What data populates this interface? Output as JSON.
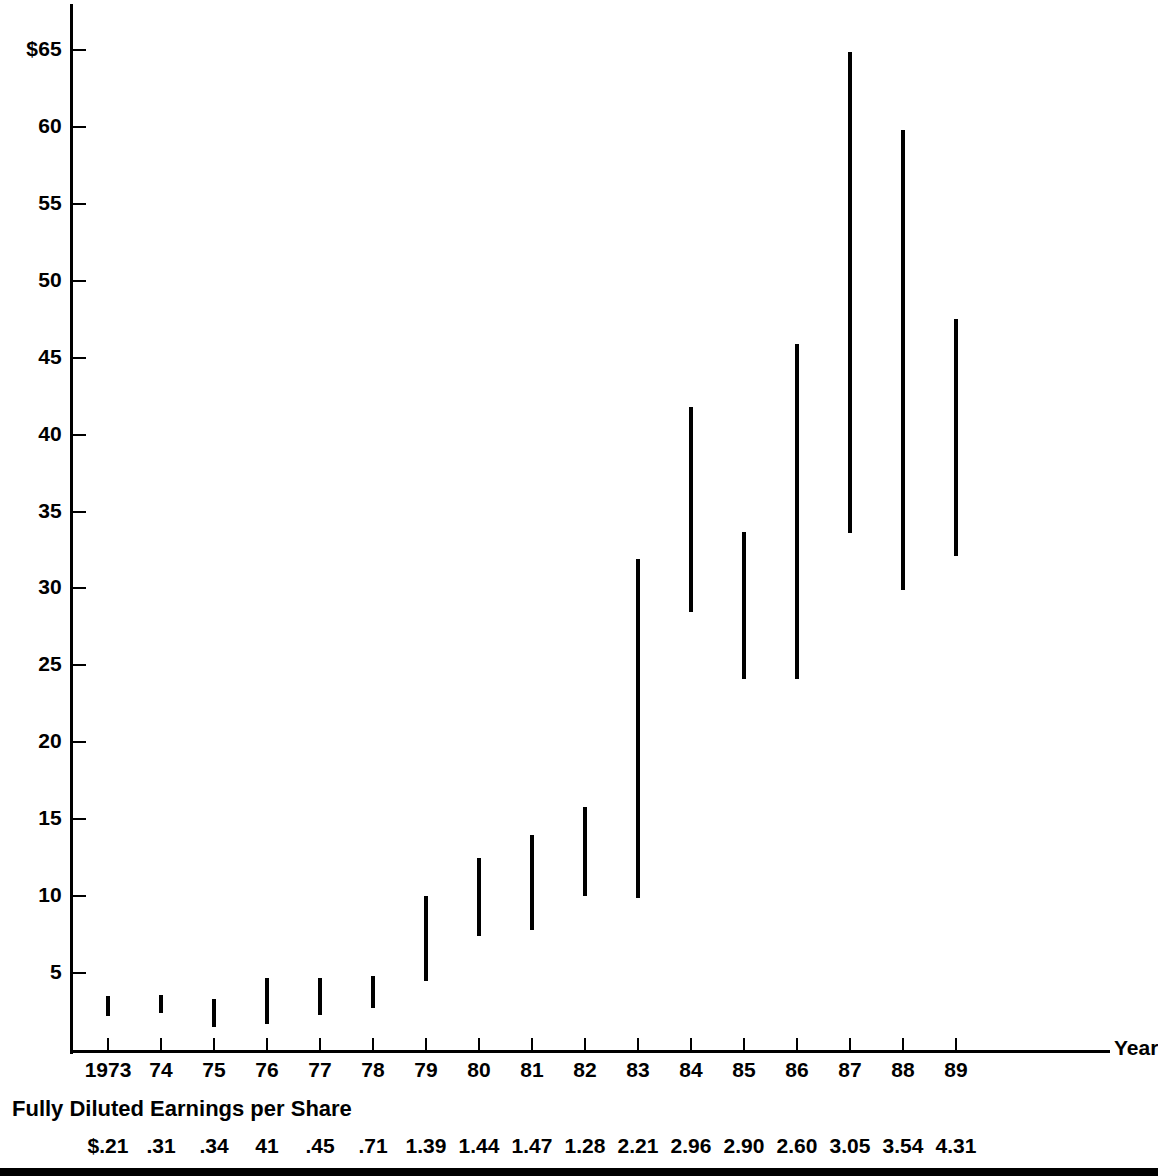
{
  "chart_data": {
    "type": "bar",
    "subtype": "high-low price range (floating bars)",
    "title": "",
    "title_note": "cropped off the top edge of the screenshot",
    "xlabel": "Year",
    "ylabel": "",
    "ylim": [
      0,
      67
    ],
    "grid": false,
    "legend": null,
    "y_ticks": [
      {
        "value": 65,
        "label": "$65"
      },
      {
        "value": 60,
        "label": "60"
      },
      {
        "value": 55,
        "label": "55"
      },
      {
        "value": 50,
        "label": "50"
      },
      {
        "value": 45,
        "label": "45"
      },
      {
        "value": 40,
        "label": "40"
      },
      {
        "value": 35,
        "label": "35"
      },
      {
        "value": 30,
        "label": "30"
      },
      {
        "value": 25,
        "label": "25"
      },
      {
        "value": 20,
        "label": "20"
      },
      {
        "value": 15,
        "label": "15"
      },
      {
        "value": 10,
        "label": "10"
      },
      {
        "value": 5,
        "label": "5"
      }
    ],
    "categories": [
      "1973",
      "74",
      "75",
      "76",
      "77",
      "78",
      "79",
      "80",
      "81",
      "82",
      "83",
      "84",
      "85",
      "86",
      "87",
      "88",
      "89"
    ],
    "series": [
      {
        "name": "Price range low",
        "values": [
          2.2,
          2.4,
          1.5,
          1.7,
          2.3,
          2.7,
          4.5,
          7.4,
          7.8,
          10.0,
          9.9,
          28.5,
          24.1,
          24.1,
          33.6,
          29.9,
          32.1
        ]
      },
      {
        "name": "Price range high",
        "values": [
          3.5,
          3.6,
          3.3,
          4.7,
          4.7,
          4.8,
          10.0,
          12.5,
          14.0,
          15.8,
          31.9,
          41.8,
          33.7,
          45.9,
          64.9,
          59.8,
          47.5
        ]
      }
    ],
    "secondary_axis": {
      "label": "Fully Diluted Earnings per Share",
      "values": [
        "$.21",
        ".31",
        ".34",
        "41",
        ".45",
        ".71",
        "1.39",
        "1.44",
        "1.47",
        "1.28",
        "2.21",
        "2.96",
        "2.90",
        "2.60",
        "3.05",
        "3.54",
        "4.31"
      ]
    }
  },
  "axes": {
    "x_axis_label": "Year",
    "x_tick_labels": [
      "1973",
      "74",
      "75",
      "76",
      "77",
      "78",
      "79",
      "80",
      "81",
      "82",
      "83",
      "84",
      "85",
      "86",
      "87",
      "88",
      "89"
    ],
    "y_tick_labels": [
      "$65",
      "60",
      "55",
      "50",
      "45",
      "40",
      "35",
      "30",
      "25",
      "20",
      "15",
      "10",
      "5"
    ]
  },
  "eps": {
    "heading": "Fully Diluted Earnings per Share",
    "values": [
      "$.21",
      ".31",
      ".34",
      "41",
      ".45",
      ".71",
      "1.39",
      "1.44",
      "1.47",
      "1.28",
      "2.21",
      "2.96",
      "2.90",
      "2.60",
      "3.05",
      "3.54",
      "4.31"
    ]
  },
  "title": {
    "text": ""
  },
  "colors": {
    "ink": "#000000",
    "paper": "#ffffff"
  }
}
